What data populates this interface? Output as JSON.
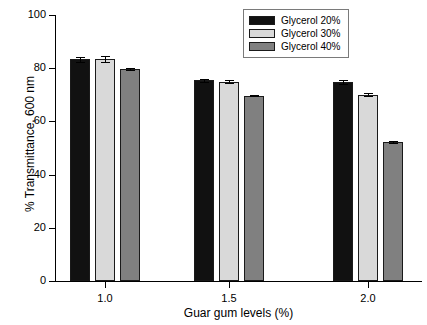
{
  "chart_data": {
    "type": "bar",
    "title": "",
    "xlabel": "Guar gum levels (%)",
    "ylabel": "% Transmittance, 600 nm",
    "categories": [
      "1.0",
      "1.5",
      "2.0"
    ],
    "ylim": [
      0,
      100
    ],
    "yticks": [
      "0",
      "20",
      "40",
      "60",
      "80",
      "100"
    ],
    "grid": false,
    "legend_position": "top-right",
    "series": [
      {
        "name": "Glycerol 20%",
        "color": "#111111",
        "values": [
          83.3,
          75.4,
          74.8
        ],
        "errors": [
          0.8,
          0.6,
          0.9
        ]
      },
      {
        "name": "Glycerol 30%",
        "color": "#d9d9d9",
        "values": [
          83.5,
          75.0,
          70.1
        ],
        "errors": [
          1.0,
          0.4,
          0.4
        ]
      },
      {
        "name": "Glycerol 40%",
        "color": "#808080",
        "values": [
          79.8,
          69.7,
          52.3
        ],
        "errors": [
          0.4,
          0.3,
          0.4
        ]
      }
    ]
  },
  "axes": {
    "y_title": "% Transmittance, 600 nm",
    "x_title": "Guar gum levels (%)",
    "y_tick_labels": [
      "100",
      "80",
      "60",
      "40",
      "20",
      "0"
    ],
    "x_tick_labels": [
      "1.0",
      "1.5",
      "2.0"
    ]
  },
  "legend": {
    "items": [
      {
        "label": "Glycerol 20%",
        "color": "#111111"
      },
      {
        "label": "Glycerol 30%",
        "color": "#d9d9d9"
      },
      {
        "label": "Glycerol 40%",
        "color": "#808080"
      }
    ]
  }
}
